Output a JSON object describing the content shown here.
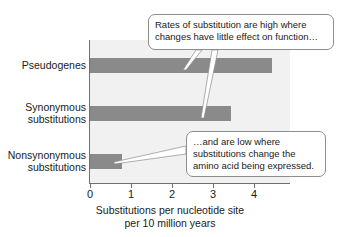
{
  "chart_data": {
    "type": "bar",
    "orientation": "horizontal",
    "title": "",
    "categories": [
      "Pseudogenes",
      "Synonymous substitutions",
      "Nonsynonymous substitutions"
    ],
    "category_lines": [
      [
        "Pseudogenes"
      ],
      [
        "Synonymous",
        "substitutions"
      ],
      [
        "Nonsynonymous",
        "substitutions"
      ]
    ],
    "values": [
      4.45,
      3.46,
      0.78
    ],
    "xlabel_lines": [
      "Substitutions per nucleotide site",
      "per 10 million years"
    ],
    "xlabel": "Substitutions per nucleotide site per 10 million years",
    "ylabel": "",
    "xlim": [
      0,
      4.9
    ],
    "xticks": [
      0,
      1,
      2,
      3,
      4
    ],
    "xticklabels": [
      "0",
      "1",
      "2",
      "3",
      "4"
    ],
    "grid": false,
    "legend": false,
    "bar_color": "#8a8a8a",
    "plot_background": "#f1f1f1",
    "axis_color": "#6f6f6f",
    "annotations": [
      {
        "id": "callout-high",
        "lines": [
          "Rates of substitution are high where",
          "changes have little effect on function…"
        ],
        "points_to": [
          "Pseudogenes",
          "Synonymous substitutions"
        ]
      },
      {
        "id": "callout-low",
        "lines": [
          "…and are low where",
          "substitutions change the",
          "amino acid being expressed."
        ],
        "points_to": [
          "Nonsynonymous substitutions"
        ]
      }
    ]
  }
}
